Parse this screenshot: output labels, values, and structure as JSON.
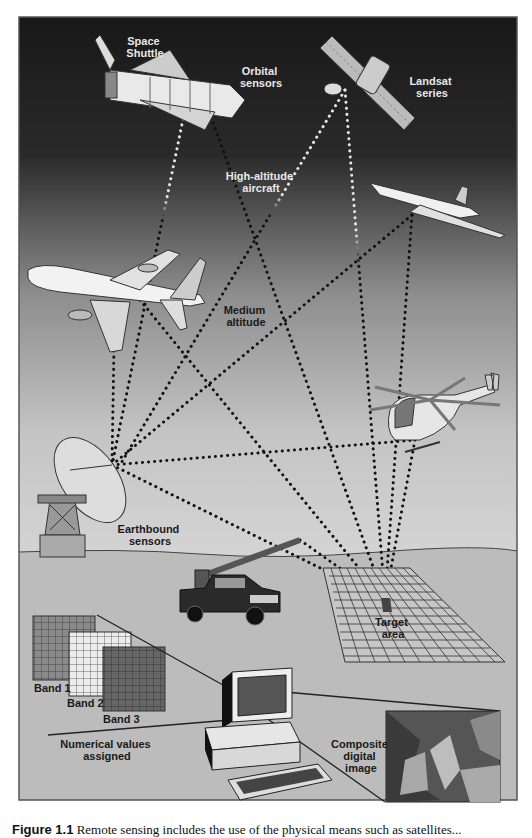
{
  "figure": {
    "labels": {
      "space_shuttle": [
        "Space",
        "Shuttle"
      ],
      "orbital_sensors": [
        "Orbital",
        "sensors"
      ],
      "landsat_series": [
        "Landsat",
        "series"
      ],
      "high_altitude_aircraft": [
        "High-altitude",
        "aircraft"
      ],
      "medium_altitude": [
        "Medium",
        "altitude"
      ],
      "earthbound_sensors": [
        "Earthbound",
        "sensors"
      ],
      "target_area": [
        "Target",
        "area"
      ],
      "band_1": "Band 1",
      "band_2": "Band 2",
      "band_3": "Band 3",
      "numerical_values": [
        "Numerical values",
        "assigned"
      ],
      "composite_image": [
        "Composite",
        "digital",
        "image"
      ]
    },
    "colors": {
      "sky_top": "#1c1c1c",
      "sky_bottom": "#c9c9c9",
      "ground": "#bdbdbd",
      "border": "#555555",
      "dotted_line_light": "#e0e0e0",
      "dotted_line_dark": "#111111"
    }
  },
  "caption": {
    "label": "Figure 1.1",
    "text": "Remote sensing includes the use of the physical means such as satellites..."
  }
}
